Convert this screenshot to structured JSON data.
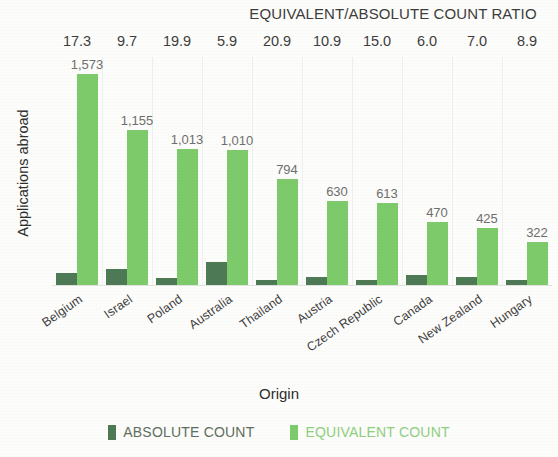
{
  "chart_data": {
    "type": "bar",
    "title": "EQUIVALENT/ABSOLUTE COUNT RATIO",
    "xlabel": "Origin",
    "ylabel": "Applications abroad",
    "grid": true,
    "legend_position": "bottom",
    "ylim": [
      0,
      1700
    ],
    "categories": [
      "Belgium",
      "Israel",
      "Poland",
      "Australia",
      "Thailand",
      "Austria",
      "Czech Republic",
      "Canada",
      "New Zealand",
      "Hungary"
    ],
    "ratio_axis_label": "EQUIVALENT/ABSOLUTE COUNT RATIO",
    "ratios": [
      "17.3",
      "9.7",
      "19.9",
      "5.9",
      "20.9",
      "10.9",
      "15.0",
      "6.0",
      "7.0",
      "8.9"
    ],
    "series": [
      {
        "name": "ABSOLUTE COUNT",
        "color": "#4e7a55",
        "values": [
          91,
          119,
          51,
          171,
          38,
          58,
          41,
          78,
          61,
          36
        ],
        "labels": [
          "",
          "",
          "",
          "",
          "",
          "",
          "",
          "",
          "",
          ""
        ]
      },
      {
        "name": "EQUIVALENT COUNT",
        "color": "#7dcb6b",
        "values": [
          1573,
          1155,
          1013,
          1010,
          794,
          630,
          613,
          470,
          425,
          322
        ],
        "labels": [
          "1,573",
          "1,155",
          "1,013",
          "1,010",
          "794",
          "630",
          "613",
          "470",
          "425",
          "322"
        ]
      }
    ]
  },
  "legend": {
    "items": [
      {
        "label": "ABSOLUTE COUNT",
        "color": "#4e7a55"
      },
      {
        "label": "EQUIVALENT COUNT",
        "color": "#7dcb6b"
      }
    ]
  }
}
